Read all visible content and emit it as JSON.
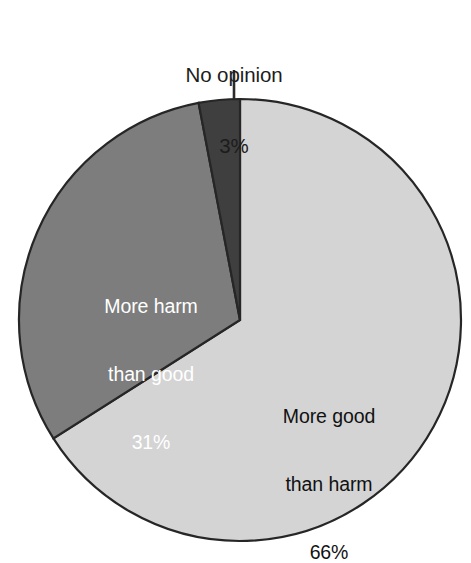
{
  "chart_data": {
    "type": "pie",
    "title": "",
    "subtitle": "",
    "xlabel": "",
    "ylabel": "",
    "legend_position": "none",
    "grid": false,
    "start_angle_deg": 0,
    "direction": "clockwise",
    "units": "percent",
    "categories": [
      "More good than harm",
      "More harm than good",
      "No opinion"
    ],
    "values": [
      66,
      31,
      3
    ],
    "value_labels": [
      "66%",
      "31%",
      "3%"
    ],
    "colors": [
      "#d4d4d4",
      "#7d7d7d",
      "#3f3f3f"
    ],
    "outline_color": "#262626",
    "slices": [
      {
        "name": "more-good-than-harm",
        "label_line_1": "More good",
        "label_line_2": "than harm",
        "value": 66,
        "value_label": "66%",
        "color": "#d4d4d4",
        "text_color": "#111111",
        "label_placement": "inside"
      },
      {
        "name": "more-harm-than-good",
        "label_line_1": "More harm",
        "label_line_2": "than good",
        "value": 31,
        "value_label": "31%",
        "color": "#7d7d7d",
        "text_color": "#ffffff",
        "label_placement": "inside"
      },
      {
        "name": "no-opinion",
        "label_line_1": "No opinion",
        "label_line_2": "",
        "value": 3,
        "value_label": "3%",
        "color": "#3f3f3f",
        "text_color": "#1c1c1c",
        "label_placement": "outside-with-leader"
      }
    ]
  },
  "geometry": {
    "center_x": 240,
    "center_y": 320,
    "radius": 221,
    "leader_x": 234,
    "leader_y_top": 70,
    "leader_y_bottom": 99
  }
}
